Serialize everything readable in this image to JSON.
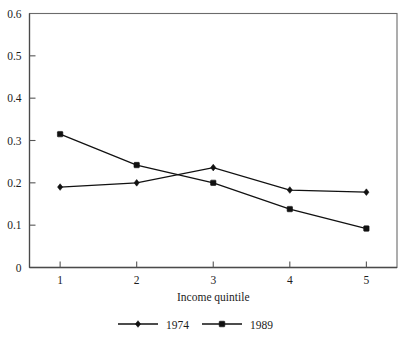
{
  "chart_data": {
    "type": "line",
    "title": "",
    "xlabel": "Income quintile",
    "ylabel": "",
    "categories": [
      "1",
      "2",
      "3",
      "4",
      "5"
    ],
    "x": [
      1,
      2,
      3,
      4,
      5
    ],
    "xlim": [
      0.6,
      5.4
    ],
    "ylim": [
      0,
      0.6
    ],
    "ytick_labels": [
      "0",
      "0.1",
      "0.2",
      "0.3",
      "0.4",
      "0.5",
      "0.6"
    ],
    "yticks": [
      0,
      0.1,
      0.2,
      0.3,
      0.4,
      0.5,
      0.6
    ],
    "xtick_labels": [
      "1",
      "2",
      "3",
      "4",
      "5"
    ],
    "grid": false,
    "legend_position": "bottom-center",
    "series": [
      {
        "name": "1974",
        "marker": "diamond",
        "color": "#111111",
        "values": [
          0.19,
          0.2,
          0.236,
          0.183,
          0.178
        ]
      },
      {
        "name": "1989",
        "marker": "square",
        "color": "#111111",
        "values": [
          0.315,
          0.242,
          0.2,
          0.138,
          0.092
        ]
      }
    ]
  },
  "axis": {
    "x_title": "Income quintile"
  },
  "legend": {
    "entries": [
      {
        "label": "1974"
      },
      {
        "label": "1989"
      }
    ]
  }
}
